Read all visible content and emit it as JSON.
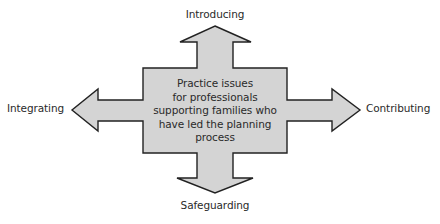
{
  "diagram": {
    "type": "four-way-arrow",
    "colors": {
      "fill": "#d4d4d4",
      "stroke": "#222222",
      "text": "#2a2a2a",
      "background": "#ffffff"
    },
    "center": {
      "lines": [
        "Practice issues",
        "for professionals",
        "supporting families who",
        "have led the planning",
        "process"
      ]
    },
    "arrows": {
      "top": {
        "label": "Introducing"
      },
      "left": {
        "label": "Integrating"
      },
      "right": {
        "label": "Contributing"
      },
      "bottom": {
        "label": "Safeguarding"
      }
    }
  }
}
